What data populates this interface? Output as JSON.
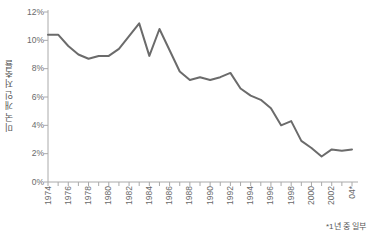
{
  "chart_data": {
    "type": "line",
    "title": "",
    "subtitle": "",
    "xlabel": "",
    "ylabel": "미국 개인 저축률",
    "ylim": [
      0,
      12
    ],
    "ytick_values": [
      0,
      2,
      4,
      6,
      8,
      10,
      12
    ],
    "ytick_labels": [
      "0%",
      "2%",
      "4%",
      "6%",
      "8%",
      "10%",
      "12%"
    ],
    "xlim": [
      1974,
      2004
    ],
    "xtick_values": [
      1974,
      1975,
      1976,
      1977,
      1978,
      1979,
      1980,
      1981,
      1982,
      1983,
      1984,
      1985,
      1986,
      1987,
      1988,
      1989,
      1990,
      1991,
      1992,
      1993,
      1994,
      1995,
      1996,
      1997,
      1998,
      1999,
      2000,
      2001,
      2002,
      2003,
      2004
    ],
    "xtick_labels": [
      "1974",
      "",
      "1976",
      "",
      "1978",
      "",
      "1980",
      "",
      "1982",
      "",
      "1984",
      "",
      "1986",
      "",
      "1988",
      "",
      "1990",
      "",
      "1992",
      "",
      "1994",
      "",
      "1996",
      "",
      "1998",
      "",
      "2000",
      "",
      "2002",
      "",
      "04*"
    ],
    "grid": false,
    "legend": false,
    "line_color": "#6b6b6b",
    "axis_color": "#aaaaaa",
    "text_color": "#6a6a6a",
    "annotation": "*1년 중 일부",
    "series": [
      {
        "name": "미국 개인 저축률",
        "x": [
          1974,
          1975,
          1976,
          1977,
          1978,
          1979,
          1980,
          1981,
          1982,
          1983,
          1984,
          1985,
          1986,
          1987,
          1988,
          1989,
          1990,
          1991,
          1992,
          1993,
          1994,
          1995,
          1996,
          1997,
          1998,
          1999,
          2000,
          2001,
          2002,
          2003,
          2004
        ],
        "values": [
          10.4,
          10.4,
          9.6,
          9.0,
          8.7,
          8.9,
          8.9,
          9.4,
          10.3,
          11.2,
          8.9,
          10.8,
          9.3,
          7.8,
          7.2,
          7.4,
          7.2,
          7.4,
          7.7,
          6.6,
          6.1,
          5.8,
          5.2,
          4.0,
          4.3,
          2.9,
          2.4,
          1.8,
          2.3,
          2.2,
          2.3
        ]
      }
    ]
  },
  "axis_geometry": {
    "plot_left": 48,
    "plot_right": 352,
    "plot_top": 12,
    "plot_bottom": 182
  }
}
